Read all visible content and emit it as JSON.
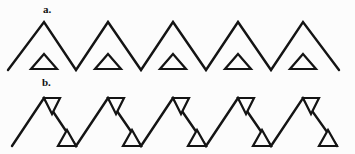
{
  "figure": {
    "width": 355,
    "height": 154,
    "background_color": "#fcfcfc",
    "stroke_color": "#141414",
    "fill_color": "#fcfcfc"
  },
  "panels": [
    {
      "id": "panel-a",
      "label": "a.",
      "label_x": 43,
      "label_y": 4,
      "description": "zigzag with upright outline triangles in the valleys",
      "zigzag": {
        "peak_y": 22,
        "valley_y": 70,
        "points": "8,70 44,22 76,70 108,22 141,70 173,22 206,70 238,22 271,70 303,22 339,70"
      },
      "small_triangles": [
        {
          "cx": 44,
          "base_y": 69,
          "apex_y": 54,
          "half_width": 13
        },
        {
          "cx": 108,
          "base_y": 69,
          "apex_y": 54,
          "half_width": 13
        },
        {
          "cx": 173,
          "base_y": 69,
          "apex_y": 54,
          "half_width": 13
        },
        {
          "cx": 238,
          "base_y": 69,
          "apex_y": 54,
          "half_width": 13
        },
        {
          "cx": 303,
          "base_y": 69,
          "apex_y": 54,
          "half_width": 13
        }
      ]
    },
    {
      "id": "panel-b",
      "label": "b.",
      "label_x": 42,
      "label_y": 77,
      "description": "zigzag with right triangles straddling each peak and valley",
      "zigzag": {
        "peak_y": 98,
        "valley_y": 146,
        "points": "12,146 44,98 76,146 108,98 141,146 173,98 206,146 238,98 271,146 303,98 337,146"
      },
      "peak_triangles": [
        {
          "x": 44,
          "y": 98,
          "run": 16,
          "drop": 16
        },
        {
          "x": 108,
          "y": 98,
          "run": 16,
          "drop": 16
        },
        {
          "x": 173,
          "y": 98,
          "run": 16,
          "drop": 16
        },
        {
          "x": 238,
          "y": 98,
          "run": 16,
          "drop": 16
        },
        {
          "x": 303,
          "y": 98,
          "run": 16,
          "drop": 16
        }
      ],
      "valley_triangles": [
        {
          "x": 76,
          "y": 146,
          "run": -18,
          "rise": 16
        },
        {
          "x": 141,
          "y": 146,
          "run": -18,
          "rise": 16
        },
        {
          "x": 206,
          "y": 146,
          "run": -18,
          "rise": 16
        },
        {
          "x": 271,
          "y": 146,
          "run": -18,
          "rise": 16
        },
        {
          "x": 337,
          "y": 146,
          "run": -18,
          "rise": 16
        }
      ]
    }
  ],
  "chart_data": {
    "type": "line",
    "title": "",
    "xlabel": "",
    "ylabel": "",
    "grid": false,
    "legend": "none",
    "series": [
      {
        "name": "a. zigzag baseline",
        "x": [
          8,
          44,
          76,
          108,
          141,
          173,
          206,
          238,
          271,
          303,
          339
        ],
        "y": [
          70,
          22,
          70,
          22,
          70,
          22,
          70,
          22,
          70,
          22,
          70
        ]
      },
      {
        "name": "b. zigzag baseline",
        "x": [
          12,
          44,
          76,
          108,
          141,
          173,
          206,
          238,
          271,
          303,
          337
        ],
        "y": [
          146,
          98,
          146,
          98,
          146,
          98,
          146,
          98,
          146,
          98,
          146
        ]
      }
    ],
    "annotations": [
      "a.",
      "b."
    ]
  }
}
